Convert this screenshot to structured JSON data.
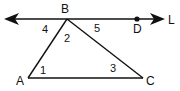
{
  "diagram": {
    "type": "geometry",
    "stroke_color": "#111111",
    "line": {
      "name": "line through B and D",
      "arrow_left": true,
      "arrow_right": true,
      "end_label": "L"
    },
    "points": {
      "B": {
        "label": "B"
      },
      "D": {
        "label": "D"
      },
      "A": {
        "label": "A"
      },
      "C": {
        "label": "C"
      }
    },
    "triangle": "ABC",
    "angles": [
      {
        "label": "1",
        "at": "A"
      },
      {
        "label": "2",
        "at": "B (interior)"
      },
      {
        "label": "3",
        "at": "C"
      },
      {
        "label": "4",
        "at": "B (between line and BA)"
      },
      {
        "label": "5",
        "at": "B (between BC and BD)"
      }
    ]
  }
}
